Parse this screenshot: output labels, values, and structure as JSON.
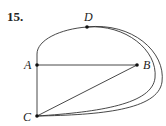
{
  "problem": {
    "number": "15."
  },
  "graph": {
    "vertices": [
      {
        "id": "A",
        "label": "A",
        "x": 37,
        "y": 65,
        "label_x": 24,
        "label_y": 69
      },
      {
        "id": "B",
        "label": "B",
        "x": 137,
        "y": 65,
        "label_x": 143,
        "label_y": 69
      },
      {
        "id": "C",
        "label": "C",
        "x": 37,
        "y": 116,
        "label_x": 23,
        "label_y": 121
      },
      {
        "id": "D",
        "label": "D",
        "x": 87,
        "y": 27,
        "label_x": 84,
        "label_y": 21
      }
    ],
    "edges": [
      {
        "from": "A",
        "to": "B",
        "type": "straight"
      },
      {
        "from": "A",
        "to": "C",
        "type": "straight"
      },
      {
        "from": "C",
        "to": "B",
        "type": "straight"
      },
      {
        "from": "A",
        "to": "D",
        "type": "curved"
      },
      {
        "from": "D",
        "to": "C",
        "type": "curved",
        "note": "inner arc"
      },
      {
        "from": "D",
        "to": "C",
        "type": "curved",
        "note": "outer arc"
      }
    ],
    "stroke_color": "#333333",
    "vertex_color": "#111111"
  }
}
